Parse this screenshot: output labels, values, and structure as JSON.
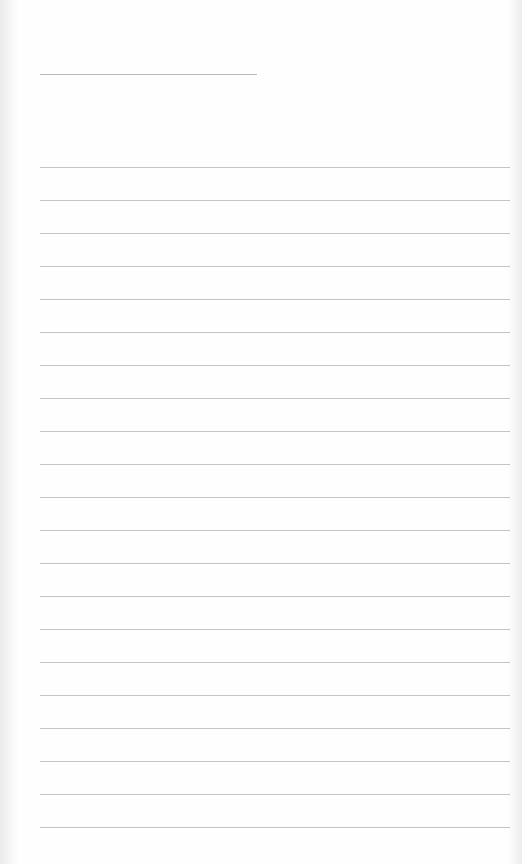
{
  "page": {
    "type": "blank lined paper",
    "background_color": "#fefefe",
    "line_color": "#c4c4c4",
    "header_line": {
      "x": 40,
      "y": 74,
      "width": 217
    },
    "rules": {
      "count": 21,
      "start_y": 167,
      "spacing": 33,
      "x": 40,
      "width": 470
    }
  }
}
